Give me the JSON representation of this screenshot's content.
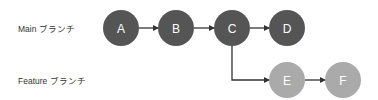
{
  "branches": {
    "main": {
      "label": "Main ブランチ",
      "color": "#555555",
      "y": 28
    },
    "feature": {
      "label": "Feature ブランチ",
      "color": "#aaaaaa",
      "y": 80
    }
  },
  "commits": [
    {
      "id": "A",
      "label": "A",
      "branch": "main",
      "x": 121,
      "y": 28
    },
    {
      "id": "B",
      "label": "B",
      "branch": "main",
      "x": 176,
      "y": 28
    },
    {
      "id": "C",
      "label": "C",
      "branch": "main",
      "x": 232,
      "y": 28
    },
    {
      "id": "D",
      "label": "D",
      "branch": "main",
      "x": 287,
      "y": 28
    },
    {
      "id": "E",
      "label": "E",
      "branch": "feature",
      "x": 287,
      "y": 80
    },
    {
      "id": "F",
      "label": "F",
      "branch": "feature",
      "x": 343,
      "y": 80
    }
  ],
  "edges": [
    {
      "from": "A",
      "to": "B"
    },
    {
      "from": "B",
      "to": "C"
    },
    {
      "from": "C",
      "to": "D"
    },
    {
      "from": "C",
      "to": "E",
      "type": "branch"
    },
    {
      "from": "E",
      "to": "F"
    }
  ],
  "edge_color": "#333333"
}
